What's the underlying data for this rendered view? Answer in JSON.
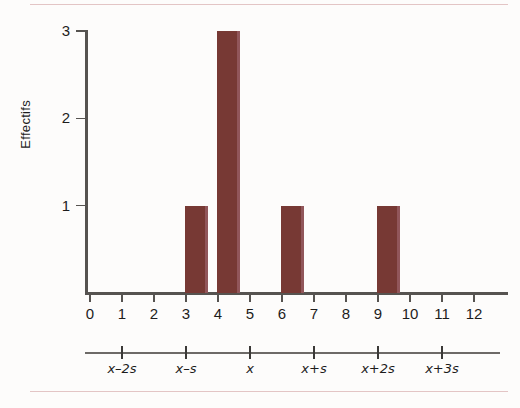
{
  "chart_data": {
    "type": "bar",
    "title": "",
    "subtitle": "",
    "xlabel": "",
    "ylabel": "Effectifs",
    "x": [
      0,
      1,
      2,
      3,
      4,
      5,
      6,
      7,
      8,
      9,
      10,
      11,
      12
    ],
    "categories": [
      "0",
      "1",
      "2",
      "3",
      "4",
      "5",
      "6",
      "7",
      "8",
      "9",
      "10",
      "11",
      "12"
    ],
    "values": [
      0,
      0,
      0,
      1,
      3,
      0,
      1,
      0,
      0,
      1,
      0,
      0,
      0
    ],
    "bars": [
      {
        "x": 3,
        "value": 1
      },
      {
        "x": 4,
        "value": 3
      },
      {
        "x": 6,
        "value": 1
      },
      {
        "x": 9,
        "value": 1
      }
    ],
    "xlim": [
      0,
      13.2
    ],
    "ylim": [
      0,
      3
    ],
    "y_ticks": [
      "1",
      "2",
      "3"
    ],
    "y_tick_values": [
      1,
      2,
      3
    ],
    "x_ticks": [
      "0",
      "1",
      "2",
      "3",
      "4",
      "5",
      "6",
      "7",
      "8",
      "9",
      "10",
      "11",
      "12"
    ],
    "grid": false,
    "legend": false,
    "legend_position": "none",
    "bar_color": "#773934",
    "bar_shade_color": "#91565a",
    "axis_color": "#565350",
    "background_color": "#fdfcfb",
    "secondary_axis": {
      "label": "",
      "ticks": [
        {
          "label": "x–2s",
          "x_value": 1
        },
        {
          "label": "x–s",
          "x_value": 3
        },
        {
          "label": "x",
          "x_value": 5
        },
        {
          "label": "x+s",
          "x_value": 7
        },
        {
          "label": "x+2s",
          "x_value": 9
        },
        {
          "label": "x+3s",
          "x_value": 11
        }
      ],
      "line_color": "#6d6a67",
      "tick_color": "#3b3937"
    },
    "annotations": []
  },
  "figure": {
    "rule_color": "#e3c5c5"
  }
}
